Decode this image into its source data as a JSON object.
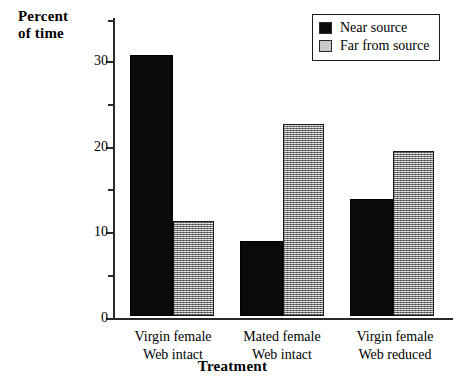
{
  "chart_data": {
    "type": "bar",
    "title": "",
    "xlabel": "Treatment",
    "ylabel": "Percent\nof  time",
    "categories": [
      "Virgin female\nWeb intact",
      "Mated female\nWeb intact",
      "Virgin female\nWeb reduced"
    ],
    "series": [
      {
        "name": "Near source",
        "color": "#0a0a0a",
        "values": [
          30.5,
          8.7,
          13.6
        ]
      },
      {
        "name": "Far from source",
        "color": "#b0b0b0",
        "values": [
          11.1,
          22.4,
          19.2
        ]
      }
    ],
    "ylim": [
      0,
      35
    ],
    "y_major_ticks": [
      0,
      10,
      20,
      30
    ],
    "y_minor_ticks": [
      5,
      15,
      25,
      35
    ],
    "y_tick_labels": [
      "0",
      "10",
      "20",
      "30"
    ],
    "grid": false,
    "legend_position": "top-right"
  },
  "axis": {
    "y_title": "Percent\nof  time",
    "x_title": "Treatment",
    "tick_0": "0",
    "tick_10": "10",
    "tick_20": "20",
    "tick_30": "30"
  },
  "legend": {
    "items": [
      {
        "label": "Near source"
      },
      {
        "label": "Far from source"
      }
    ]
  },
  "categories": [
    {
      "label": "Virgin female\nWeb intact"
    },
    {
      "label": "Mated female\nWeb intact"
    },
    {
      "label": "Virgin female\nWeb reduced"
    }
  ]
}
